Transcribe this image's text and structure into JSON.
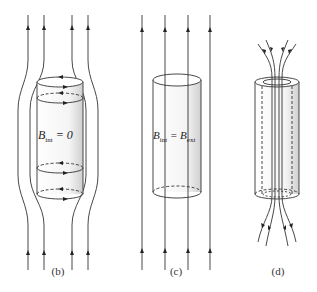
{
  "panels": [
    {
      "id": "b",
      "caption": "(b)",
      "equation": {
        "lhs": "B",
        "lhs_sub": "int",
        "rel": " = ",
        "rhs": "0",
        "rhs_sub": ""
      },
      "description": "Superconductor: field lines expelled around cylinder, surface currents shown as circular arrows"
    },
    {
      "id": "c",
      "caption": "(c)",
      "equation": {
        "lhs": "B",
        "lhs_sub": "int",
        "rel": " = ",
        "rhs": "B",
        "rhs_sub": "ext"
      },
      "description": "Normal state: uniform field lines pass straight through cylinder"
    },
    {
      "id": "d",
      "caption": "(d)",
      "equation": null,
      "description": "Hollow cylinder with field lines concentrated through the interior"
    }
  ],
  "colors": {
    "line": "#333333",
    "shade": "#d8d8d8"
  }
}
